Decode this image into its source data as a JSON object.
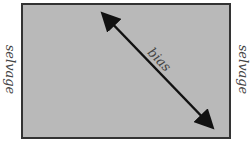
{
  "diagram": {
    "labels": {
      "left_edge": "selvage",
      "right_edge": "selvage",
      "diagonal": "bias"
    },
    "colors": {
      "fabric": "#b9b9b9",
      "border": "#333333",
      "arrow": "#111111"
    }
  }
}
